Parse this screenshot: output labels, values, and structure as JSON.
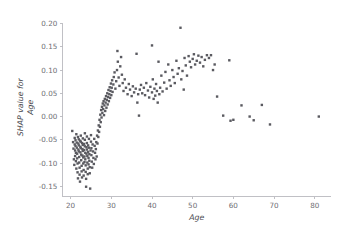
{
  "chart_data": {
    "type": "scatter",
    "title": "",
    "xlabel": "Age",
    "ylabel": "SHAP value for\nAge",
    "ylabel_line1": "SHAP value for",
    "ylabel_line2": "Age",
    "xlim": [
      18.0,
      84.0
    ],
    "ylim": [
      -0.172,
      0.212
    ],
    "xticks": [
      20,
      30,
      40,
      50,
      60,
      70,
      80
    ],
    "xticklabels": [
      "20",
      "30",
      "40",
      "50",
      "60",
      "70",
      "80"
    ],
    "yticks": [
      0.2,
      0.15,
      0.1,
      0.05,
      0.0,
      -0.05,
      -0.1,
      -0.15
    ],
    "yticklabels": [
      "0.20",
      "0.15",
      "0.10",
      "0.05",
      "0.00",
      "-0.05",
      "-0.10",
      "-0.15"
    ],
    "grid": false,
    "legend": null,
    "marker": "square",
    "marker_color": "#5a5a60",
    "marker_size_px": 2.4,
    "background_color": "#ffffff",
    "axis_color": "#b9b9bf",
    "tick_label_color": "#6e6e73",
    "n_points": 228,
    "points": [
      [
        20.4,
        -0.031
      ],
      [
        20.6,
        -0.055
      ],
      [
        20.7,
        -0.069
      ],
      [
        20.8,
        -0.092
      ],
      [
        20.9,
        -0.104
      ],
      [
        21.0,
        -0.046
      ],
      [
        21.0,
        -0.06
      ],
      [
        21.1,
        -0.073
      ],
      [
        21.1,
        -0.085
      ],
      [
        21.2,
        -0.051
      ],
      [
        21.2,
        -0.063
      ],
      [
        21.3,
        -0.078
      ],
      [
        21.3,
        -0.096
      ],
      [
        21.4,
        -0.112
      ],
      [
        21.4,
        -0.038
      ],
      [
        21.5,
        -0.056
      ],
      [
        21.5,
        -0.067
      ],
      [
        21.6,
        -0.08
      ],
      [
        21.6,
        -0.09
      ],
      [
        21.7,
        -0.101
      ],
      [
        21.7,
        -0.12
      ],
      [
        21.8,
        -0.133
      ],
      [
        21.8,
        -0.044
      ],
      [
        21.9,
        -0.058
      ],
      [
        21.9,
        -0.071
      ],
      [
        22.0,
        -0.049
      ],
      [
        22.0,
        -0.062
      ],
      [
        22.0,
        -0.075
      ],
      [
        22.1,
        -0.087
      ],
      [
        22.1,
        -0.099
      ],
      [
        22.2,
        -0.11
      ],
      [
        22.2,
        -0.125
      ],
      [
        22.3,
        -0.14
      ],
      [
        22.3,
        -0.052
      ],
      [
        22.4,
        -0.065
      ],
      [
        22.4,
        -0.077
      ],
      [
        22.5,
        -0.041
      ],
      [
        22.5,
        -0.054
      ],
      [
        22.5,
        -0.068
      ],
      [
        22.6,
        -0.082
      ],
      [
        22.6,
        -0.094
      ],
      [
        22.7,
        -0.106
      ],
      [
        22.7,
        -0.118
      ],
      [
        22.8,
        -0.131
      ],
      [
        22.8,
        -0.057
      ],
      [
        22.9,
        -0.07
      ],
      [
        22.9,
        -0.084
      ],
      [
        23.0,
        -0.047
      ],
      [
        23.0,
        -0.061
      ],
      [
        23.0,
        -0.074
      ],
      [
        23.1,
        -0.088
      ],
      [
        23.1,
        -0.101
      ],
      [
        23.2,
        -0.115
      ],
      [
        23.2,
        -0.127
      ],
      [
        23.3,
        -0.059
      ],
      [
        23.3,
        -0.072
      ],
      [
        23.4,
        -0.086
      ],
      [
        23.4,
        -0.098
      ],
      [
        23.5,
        -0.036
      ],
      [
        23.5,
        -0.05
      ],
      [
        23.5,
        -0.064
      ],
      [
        23.6,
        -0.078
      ],
      [
        23.6,
        -0.092
      ],
      [
        23.7,
        -0.105
      ],
      [
        23.7,
        -0.119
      ],
      [
        23.8,
        -0.134
      ],
      [
        23.8,
        -0.151
      ],
      [
        23.9,
        -0.066
      ],
      [
        23.9,
        -0.08
      ],
      [
        24.0,
        -0.043
      ],
      [
        24.0,
        -0.057
      ],
      [
        24.0,
        -0.071
      ],
      [
        24.1,
        -0.085
      ],
      [
        24.1,
        -0.099
      ],
      [
        24.2,
        -0.112
      ],
      [
        24.2,
        -0.124
      ],
      [
        24.3,
        -0.062
      ],
      [
        24.3,
        -0.076
      ],
      [
        24.4,
        -0.089
      ],
      [
        24.4,
        -0.103
      ],
      [
        24.5,
        -0.048
      ],
      [
        24.5,
        -0.067
      ],
      [
        24.6,
        -0.081
      ],
      [
        24.6,
        -0.095
      ],
      [
        24.7,
        -0.109
      ],
      [
        24.7,
        -0.122
      ],
      [
        24.8,
        -0.155
      ],
      [
        24.9,
        -0.073
      ],
      [
        25.0,
        -0.04
      ],
      [
        25.0,
        -0.054
      ],
      [
        25.1,
        -0.068
      ],
      [
        25.1,
        -0.083
      ],
      [
        25.2,
        -0.097
      ],
      [
        25.3,
        -0.11
      ],
      [
        25.4,
        -0.06
      ],
      [
        25.5,
        -0.075
      ],
      [
        25.6,
        -0.089
      ],
      [
        25.7,
        -0.102
      ],
      [
        25.8,
        -0.048
      ],
      [
        25.9,
        -0.063
      ],
      [
        26.0,
        -0.078
      ],
      [
        26.1,
        -0.092
      ],
      [
        26.2,
        -0.07
      ],
      [
        26.3,
        -0.055
      ],
      [
        26.4,
        -0.086
      ],
      [
        26.5,
        -0.041
      ],
      [
        26.6,
        -0.058
      ],
      [
        26.7,
        -0.03
      ],
      [
        26.8,
        -0.044
      ],
      [
        26.9,
        -0.019
      ],
      [
        27.0,
        -0.033
      ],
      [
        27.1,
        -0.007
      ],
      [
        27.2,
        -0.022
      ],
      [
        27.3,
        0.004
      ],
      [
        27.4,
        -0.012
      ],
      [
        27.5,
        0.014
      ],
      [
        27.6,
        -0.002
      ],
      [
        27.7,
        0.021
      ],
      [
        27.8,
        0.008
      ],
      [
        27.9,
        0.028
      ],
      [
        28.0,
        0.016
      ],
      [
        28.1,
        0.033
      ],
      [
        28.2,
        0.003
      ],
      [
        28.3,
        0.024
      ],
      [
        28.4,
        0.038
      ],
      [
        28.5,
        0.012
      ],
      [
        28.6,
        0.03
      ],
      [
        28.7,
        0.044
      ],
      [
        28.8,
        0.019
      ],
      [
        28.9,
        0.036
      ],
      [
        29.0,
        0.05
      ],
      [
        29.1,
        0.026
      ],
      [
        29.2,
        0.042
      ],
      [
        29.3,
        0.057
      ],
      [
        29.4,
        0.033
      ],
      [
        29.5,
        0.048
      ],
      [
        29.6,
        0.063
      ],
      [
        29.7,
        0.04
      ],
      [
        29.8,
        0.055
      ],
      [
        29.9,
        0.071
      ],
      [
        30.0,
        0.046
      ],
      [
        30.1,
        0.062
      ],
      [
        30.2,
        0.078
      ],
      [
        30.3,
        0.053
      ],
      [
        30.5,
        0.069
      ],
      [
        30.6,
        0.085
      ],
      [
        30.8,
        0.095
      ],
      [
        31.0,
        0.06
      ],
      [
        31.2,
        0.076
      ],
      [
        31.4,
        0.1
      ],
      [
        31.5,
        0.141
      ],
      [
        31.6,
        0.118
      ],
      [
        31.8,
        0.084
      ],
      [
        32.0,
        0.066
      ],
      [
        32.2,
        0.108
      ],
      [
        32.4,
        0.128
      ],
      [
        32.6,
        0.09
      ],
      [
        32.8,
        0.072
      ],
      [
        33.0,
        0.055
      ],
      [
        33.3,
        0.08
      ],
      [
        33.6,
        0.062
      ],
      [
        34.0,
        0.048
      ],
      [
        34.3,
        0.07
      ],
      [
        34.6,
        0.058
      ],
      [
        35.0,
        0.044
      ],
      [
        35.3,
        0.065
      ],
      [
        35.6,
        0.052
      ],
      [
        36.0,
        0.06
      ],
      [
        36.2,
        0.135
      ],
      [
        36.4,
        0.03
      ],
      [
        36.6,
        0.048
      ],
      [
        36.8,
        0.002
      ],
      [
        37.0,
        0.058
      ],
      [
        37.3,
        0.068
      ],
      [
        37.6,
        0.05
      ],
      [
        38.0,
        0.062
      ],
      [
        38.3,
        0.046
      ],
      [
        38.6,
        0.072
      ],
      [
        39.0,
        0.056
      ],
      [
        39.3,
        0.041
      ],
      [
        39.6,
        0.064
      ],
      [
        40.0,
        0.153
      ],
      [
        40.0,
        0.052
      ],
      [
        40.2,
        0.08
      ],
      [
        40.4,
        0.038
      ],
      [
        40.6,
        0.06
      ],
      [
        40.8,
        0.045
      ],
      [
        41.0,
        0.07
      ],
      [
        41.2,
        0.055
      ],
      [
        41.4,
        0.03
      ],
      [
        41.6,
        0.118
      ],
      [
        41.8,
        0.048
      ],
      [
        42.0,
        0.062
      ],
      [
        42.3,
        0.088
      ],
      [
        42.6,
        0.054
      ],
      [
        43.0,
        0.073
      ],
      [
        43.3,
        0.096
      ],
      [
        43.6,
        0.06
      ],
      [
        44.0,
        0.112
      ],
      [
        44.3,
        0.078
      ],
      [
        44.6,
        0.066
      ],
      [
        45.0,
        0.1
      ],
      [
        45.3,
        0.085
      ],
      [
        45.6,
        0.072
      ],
      [
        46.0,
        0.12
      ],
      [
        46.3,
        0.092
      ],
      [
        46.6,
        0.104
      ],
      [
        47.0,
        0.191
      ],
      [
        47.2,
        0.08
      ],
      [
        47.5,
        0.098
      ],
      [
        47.8,
        0.058
      ],
      [
        48.0,
        0.126
      ],
      [
        48.3,
        0.11
      ],
      [
        48.6,
        0.088
      ],
      [
        49.0,
        0.13
      ],
      [
        49.3,
        0.118
      ],
      [
        49.6,
        0.106
      ],
      [
        50.0,
        0.124
      ],
      [
        50.3,
        0.134
      ],
      [
        50.6,
        0.112
      ],
      [
        51.0,
        0.12
      ],
      [
        51.4,
        0.131
      ],
      [
        51.8,
        0.116
      ],
      [
        52.2,
        0.128
      ],
      [
        52.6,
        0.108
      ],
      [
        53.0,
        0.122
      ],
      [
        53.5,
        0.132
      ],
      [
        54.0,
        0.126
      ],
      [
        54.5,
        0.132
      ],
      [
        55.0,
        0.1
      ],
      [
        55.4,
        0.112
      ],
      [
        56.0,
        0.043
      ],
      [
        57.5,
        0.002
      ],
      [
        59.0,
        0.121
      ],
      [
        59.3,
        -0.009
      ],
      [
        60.0,
        -0.007
      ],
      [
        62.0,
        0.024
      ],
      [
        64.0,
        0.0
      ],
      [
        65.0,
        -0.008
      ],
      [
        67.0,
        0.025
      ],
      [
        69.0,
        -0.017
      ],
      [
        81.0,
        0.0
      ]
    ]
  }
}
